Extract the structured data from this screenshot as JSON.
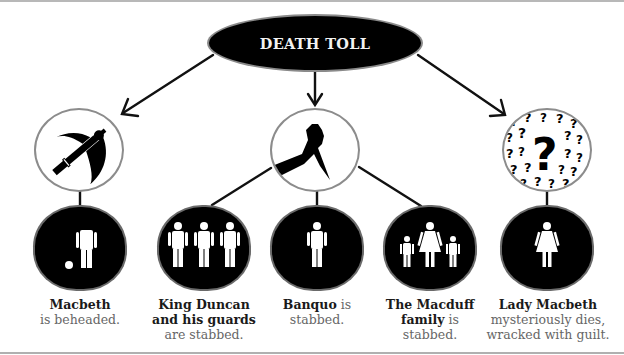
{
  "title": "DEATH TOLL",
  "causes": [
    {
      "name": "axe",
      "icon": "axe-icon"
    },
    {
      "name": "knife",
      "icon": "knife-in-hand-icon"
    },
    {
      "name": "mystery",
      "icon": "question-marks-icon"
    }
  ],
  "victims": [
    {
      "icon": "beheaded-man-icon",
      "name": "Macbeth",
      "desc": "is beheaded."
    },
    {
      "icon": "three-men-icon",
      "name_line1": "King Duncan",
      "name_line2": "and his guards",
      "desc": "are stabbed."
    },
    {
      "icon": "man-icon",
      "name": "Banquo",
      "desc_inline": "is",
      "desc": "stabbed."
    },
    {
      "icon": "family-icon",
      "name_line1": "The Macduff",
      "name_line2": "family",
      "desc_inline": "is",
      "desc": "stabbed."
    },
    {
      "icon": "woman-icon",
      "name": "Lady Macbeth",
      "desc_line1": "mysteriously dies,",
      "desc_line2": "wracked with guilt."
    }
  ],
  "colors": {
    "node": "#000000",
    "outline": "#8c8c8c",
    "caption": "#666666",
    "caption_strong": "#1a1a1a"
  }
}
